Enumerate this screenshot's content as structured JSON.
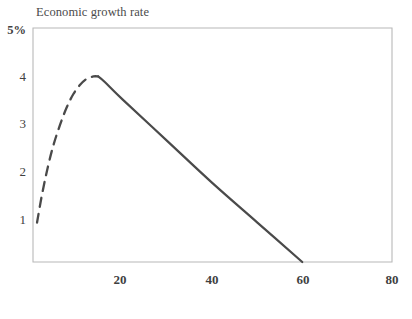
{
  "chart_data": {
    "type": "line",
    "title": "Economic growth rate",
    "xlabel": "",
    "ylabel": "Economic growth rate",
    "xlim": [
      0,
      80
    ],
    "ylim": [
      0,
      5
    ],
    "grid": false,
    "legend": null,
    "y_tick_labels": [
      "5%",
      "4",
      "3",
      "2",
      "1"
    ],
    "y_ticks": [
      5,
      4,
      3,
      2,
      1
    ],
    "x_tick_labels": [
      "20",
      "40",
      "60",
      "80"
    ],
    "x_ticks": [
      20,
      40,
      60,
      80
    ],
    "series": [
      {
        "name": "Economic growth rate (rising phase)",
        "style": "dashed",
        "color": "#4a4a4a",
        "points": [
          [
            0.9,
            0.85
          ],
          [
            2.0,
            1.45
          ],
          [
            3.2,
            2.0
          ],
          [
            4.5,
            2.5
          ],
          [
            6.0,
            2.95
          ],
          [
            7.5,
            3.33
          ],
          [
            9.0,
            3.62
          ],
          [
            10.5,
            3.82
          ],
          [
            12.0,
            3.95
          ],
          [
            13.5,
            4.0
          ],
          [
            14.5,
            4.0
          ]
        ]
      },
      {
        "name": "Economic growth rate (declining phase)",
        "style": "solid",
        "color": "#4a4a4a",
        "points": [
          [
            14.5,
            4.0
          ],
          [
            16.0,
            3.88
          ],
          [
            20.0,
            3.5
          ],
          [
            30.0,
            2.6
          ],
          [
            40.0,
            1.7
          ],
          [
            50.0,
            0.85
          ],
          [
            60.0,
            0.0
          ]
        ]
      }
    ],
    "annotations": []
  },
  "axes": {
    "frame_color": "#b8b8b8",
    "line_color": "#4a4a4a",
    "background": "#ffffff"
  }
}
